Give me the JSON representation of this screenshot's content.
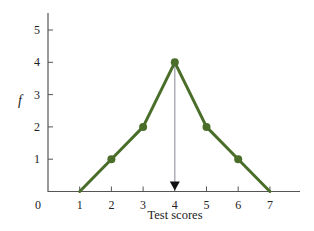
{
  "chart_data": {
    "type": "line",
    "title": "",
    "xlabel": "Test scores",
    "ylabel": "f",
    "x": [
      1,
      2,
      3,
      4,
      5,
      6,
      7
    ],
    "series": [
      {
        "name": "frequency",
        "values": [
          0,
          1,
          2,
          4,
          2,
          1,
          0
        ],
        "color": "#4a6e2a"
      }
    ],
    "xlim": [
      0,
      7.8
    ],
    "ylim": [
      0,
      5.5
    ],
    "x_ticks": [
      "0",
      "1",
      "2",
      "3",
      "4",
      "5",
      "6",
      "7"
    ],
    "y_ticks": [
      "1",
      "2",
      "3",
      "4",
      "5"
    ],
    "grid": false,
    "legend": null,
    "annotations": [
      {
        "type": "arrow",
        "x": 4,
        "from_y": 4,
        "to_y": 0,
        "color": "#9a9aa8",
        "head_color": "#111111",
        "description": "vertical line from peak down to x-axis marking the mode/center"
      }
    ]
  },
  "colors": {
    "line": "#4a6e2a",
    "axis": "#555555",
    "arrow_line": "#9a9aa8",
    "arrow_head": "#111111",
    "text": "#222222"
  }
}
